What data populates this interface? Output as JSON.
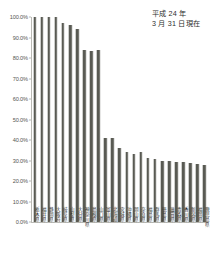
{
  "annotation": {
    "line1": "平成 24 年",
    "line2": "3 月 31 日現在"
  },
  "chart_data": {
    "type": "bar",
    "title": "",
    "subtitle": "",
    "xlabel": "",
    "ylabel": "",
    "ylim": [
      0,
      100
    ],
    "grid": false,
    "legend": false,
    "legend_position": "none",
    "annotations": [
      "平成 24 年",
      "3 月 31 日現在"
    ],
    "ytick_labels": [
      "100.0%",
      "90.0%",
      "80.0%",
      "70.0%",
      "60.0%",
      "50.0%",
      "40.0%",
      "30.0%",
      "20.0%",
      "10.0%",
      "0.0%"
    ],
    "ytick_values": [
      100,
      90,
      80,
      70,
      60,
      50,
      40,
      30,
      20,
      10,
      0
    ],
    "bar_color": "#595a53",
    "categories": [
      "栃木県",
      "福井県",
      "静岡県",
      "大阪府",
      "岐阜県",
      "山梨県",
      "大分県",
      "神奈川県",
      "島根県",
      "山口県",
      "富山県",
      "北海道",
      "宮城県",
      "沖縄県",
      "岡山県",
      "奈良県",
      "福島県",
      "群馬県",
      "徳島県",
      "滋賀県",
      "青森県",
      "香川県",
      "新潟県",
      "福岡県",
      "鹿児島県"
    ],
    "values": [
      100.0,
      100.0,
      100.0,
      100.0,
      97.0,
      96.0,
      94.0,
      84.0,
      83.5,
      84.0,
      41.0,
      41.0,
      36.0,
      34.0,
      33.0,
      34.0,
      31.0,
      30.5,
      30.0,
      30.0,
      29.5,
      29.5,
      29.0,
      28.5,
      28.0
    ]
  }
}
